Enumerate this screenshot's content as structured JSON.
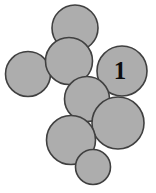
{
  "figure": {
    "canvas": {
      "width": 156,
      "height": 193,
      "background": "#ffffff"
    },
    "style": {
      "fill": "#adadad",
      "stroke": "#404040",
      "stroke_width": 1.6,
      "label_color": "#0d0d0d"
    },
    "label_text": "1"
  },
  "chart_data": {
    "type": "diagram",
    "subtype": "circle-packing",
    "units": "pixels",
    "xlim": [
      0,
      156
    ],
    "ylim": [
      0,
      193
    ],
    "grid": false,
    "legend": null,
    "circle_count": 8,
    "labeled_circle_index": 4,
    "circles": [
      {
        "id": "c1",
        "name": "top-circle",
        "cx": 75,
        "cy": 28,
        "r": 23,
        "label": ""
      },
      {
        "id": "c2",
        "name": "left-circle",
        "cx": 28,
        "cy": 74,
        "r": 22.5,
        "label": ""
      },
      {
        "id": "c3",
        "name": "upper-middle-circle",
        "cx": 69,
        "cy": 61,
        "r": 23.5,
        "label": ""
      },
      {
        "id": "c4",
        "name": "labeled-circle",
        "cx": 122,
        "cy": 71,
        "r": 25,
        "label": "1"
      },
      {
        "id": "c5",
        "name": "center-circle",
        "cx": 87,
        "cy": 99,
        "r": 22.5,
        "label": ""
      },
      {
        "id": "c6",
        "name": "lower-right-circle",
        "cx": 118,
        "cy": 123,
        "r": 26,
        "label": ""
      },
      {
        "id": "c7",
        "name": "lower-left-circle",
        "cx": 71,
        "cy": 140,
        "r": 24.5,
        "label": ""
      },
      {
        "id": "c8",
        "name": "bottom-circle",
        "cx": 93,
        "cy": 167,
        "r": 17.5,
        "label": ""
      }
    ]
  }
}
